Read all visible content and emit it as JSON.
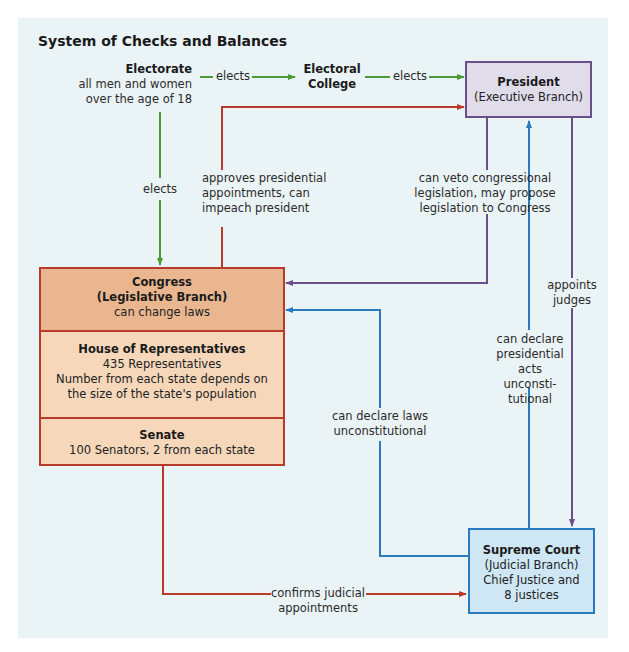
{
  "title": "System of Checks and Balances",
  "colors": {
    "panel_bg": "#eaf3f6",
    "elects_green": "#4a9a3a",
    "legislative_red": "#b83a2a",
    "executive_purple": "#6a4f8a",
    "judicial_blue": "#2a7ac0",
    "congress_header_fill": "#e9b690",
    "congress_section_fill": "#f6d7ba",
    "president_fill": "#e1dcea",
    "supreme_court_fill": "#cfe6f5"
  },
  "nodes": {
    "electorate": {
      "name": "Electorate",
      "desc_line1": "all men and women",
      "desc_line2": "over the age of 18"
    },
    "electoral_college": {
      "line1": "Electoral",
      "line2": "College"
    },
    "president": {
      "name": "President",
      "branch": "(Executive Branch)"
    },
    "congress": {
      "name": "Congress",
      "branch": "(Legislative Branch)",
      "desc": "can change laws",
      "house": {
        "name": "House of Representatives",
        "count": "435 Representatives",
        "desc_line1": "Number from each state depends on",
        "desc_line2": "the size of the state's population"
      },
      "senate": {
        "name": "Senate",
        "desc": "100 Senators, 2 from each state"
      }
    },
    "supreme_court": {
      "name": "Supreme Court",
      "branch": "(Judicial Branch)",
      "desc_line1": "Chief Justice and",
      "desc_line2": "8 justices"
    }
  },
  "edges": {
    "electorate_to_college": "elects",
    "college_to_president": "elects",
    "electorate_to_congress": "elects",
    "congress_to_president": {
      "line1": "approves presidential",
      "line2": "appointments, can",
      "line3": "impeach president"
    },
    "president_to_congress": {
      "line1": "can veto congressional",
      "line2": "legislation, may propose",
      "line3": "legislation to Congress"
    },
    "president_to_court": {
      "line1": "appoints",
      "line2": "judges"
    },
    "court_to_president": {
      "line1": "can declare",
      "line2": "presidential",
      "line3": "acts unconsti-",
      "line4": "tutional"
    },
    "court_to_congress": {
      "line1": "can declare laws",
      "line2": "unconstitutional"
    },
    "senate_to_court": {
      "line1": "confirms judicial",
      "line2": "appointments"
    }
  }
}
